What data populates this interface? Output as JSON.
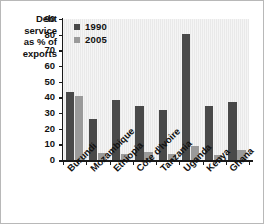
{
  "chart_data": {
    "type": "bar",
    "title": "",
    "xlabel": "",
    "ylabel": "Debt service as % of exports",
    "ylabel_lines": [
      "Debt",
      "service",
      "as % of",
      "exports"
    ],
    "ylim": [
      0,
      90
    ],
    "yticks": [
      0,
      10,
      20,
      30,
      40,
      50,
      60,
      70,
      80,
      90
    ],
    "grid": false,
    "legend_position": "top-left",
    "categories": [
      "Burundi",
      "Mozambique",
      "Ethiopia",
      "Côte d'Ivoire",
      "Tanzania",
      "Uganda",
      "Kenya",
      "Ghana"
    ],
    "series": [
      {
        "name": "1990",
        "color": "#494949",
        "values": [
          43.5,
          26,
          38.5,
          34.5,
          32,
          80.5,
          34.5,
          37
        ]
      },
      {
        "name": "2005",
        "color": "#9a9a9a",
        "values": [
          41,
          4.5,
          3.8,
          5.2,
          3.8,
          9,
          3.5,
          6.5
        ]
      }
    ]
  },
  "legend": {
    "entries": [
      {
        "label": "1990",
        "color": "#494949"
      },
      {
        "label": "2005",
        "color": "#9a9a9a"
      }
    ]
  },
  "axes": {
    "y_title_lines": [
      "Debt",
      "service",
      "as % of",
      "exports"
    ],
    "y_tick_labels": [
      "90",
      "80",
      "70",
      "60",
      "50",
      "40",
      "30",
      "20",
      "10",
      "0"
    ]
  },
  "colors": {
    "series_1990": "#494949",
    "series_2005": "#9a9a9a",
    "plot_background": "#e9e9e9",
    "axis": "#1a1a1a",
    "page_background": "#ffffff"
  }
}
